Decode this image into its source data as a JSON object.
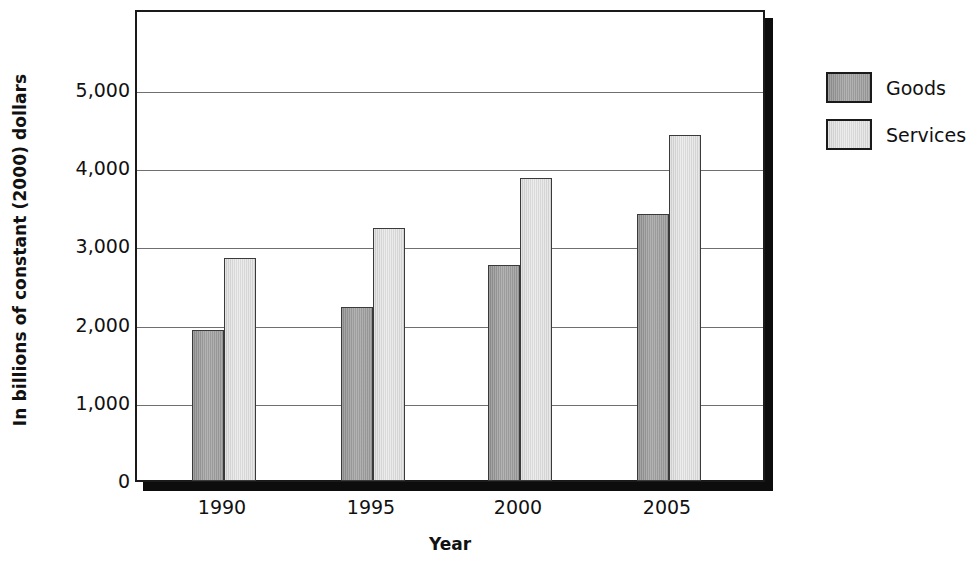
{
  "chart_data": {
    "type": "bar",
    "title": "",
    "xlabel": "Year",
    "ylabel": "In billions of constant (2000) dollars",
    "categories": [
      "1990",
      "1995",
      "2000",
      "2005"
    ],
    "series": [
      {
        "name": "Goods",
        "color": "#9a9a9a",
        "values": [
          1930,
          2230,
          2760,
          3420
        ]
      },
      {
        "name": "Services",
        "color": "#dcdcdc",
        "values": [
          2850,
          3240,
          3870,
          4430
        ]
      }
    ],
    "ylim": [
      0,
      5750
    ],
    "yticks": [
      0,
      1000,
      2000,
      3000,
      4000,
      5000
    ],
    "ytick_labels": [
      "0",
      "1,000",
      "2,000",
      "3,000",
      "4,000",
      "5,000"
    ],
    "grid": true,
    "legend_position": "right"
  },
  "legend": {
    "items": [
      {
        "label": "Goods",
        "swatch": "goods-swatch"
      },
      {
        "label": "Services",
        "swatch": "services-swatch"
      }
    ]
  }
}
